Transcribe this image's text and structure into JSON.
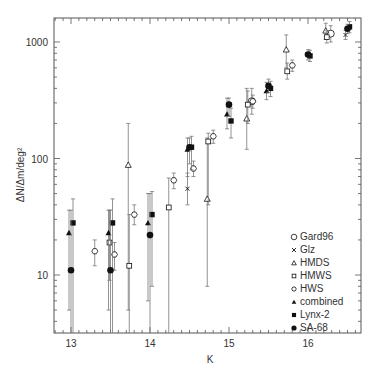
{
  "chart_data": {
    "type": "scatter",
    "title": "",
    "xlabel": "K",
    "ylabel": "ΔN/Δm/deg²",
    "xlim": [
      12.8,
      16.7
    ],
    "ylim": [
      3,
      1500
    ],
    "yscale": "log",
    "grid": false,
    "legend_position": "lower right",
    "x_ticks": [
      "13",
      "14",
      "15",
      "16"
    ],
    "y_ticks": [
      "10",
      "100",
      "1000"
    ],
    "series": [
      {
        "name": "Gard96",
        "marker": "open-circle",
        "points": [
          [
            15.25,
            310,
            240,
            400
          ],
          [
            16.25,
            1180,
            1000,
            1380
          ]
        ]
      },
      {
        "name": "Glz",
        "marker": "x",
        "points": [
          [
            14.5,
            55,
            40,
            75
          ],
          [
            16.5,
            1150,
            1050,
            1260
          ]
        ]
      },
      {
        "name": "HMDS",
        "marker": "open-triangle",
        "points": [
          [
            13.75,
            88,
            5,
            200
          ],
          [
            14.75,
            45,
            8,
            150
          ],
          [
            15.25,
            220,
            120,
            400
          ],
          [
            15.75,
            860,
            600,
            1150
          ],
          [
            16.25,
            1250,
            1050,
            1450
          ]
        ]
      },
      {
        "name": "HMWS",
        "marker": "open-square",
        "points": [
          [
            13.5,
            19,
            9,
            36
          ],
          [
            13.75,
            12,
            3,
            33
          ],
          [
            14.25,
            38,
            3,
            68
          ],
          [
            14.75,
            140,
            40,
            165
          ],
          [
            15.25,
            290,
            200,
            380
          ],
          [
            15.75,
            560,
            480,
            660
          ],
          [
            16.25,
            1100,
            980,
            1250
          ]
        ]
      },
      {
        "name": "HWS",
        "marker": "open-hexagon",
        "points": [
          [
            13.25,
            16,
            12,
            20
          ],
          [
            13.5,
            15,
            11,
            19
          ],
          [
            13.75,
            33,
            27,
            40
          ],
          [
            14.25,
            65,
            55,
            75
          ],
          [
            14.5,
            82,
            70,
            95
          ],
          [
            14.75,
            155,
            135,
            175
          ],
          [
            15.25,
            310,
            270,
            350
          ],
          [
            15.75,
            630,
            560,
            700
          ]
        ]
      },
      {
        "name": "combined",
        "marker": "filled-triangle",
        "points": [
          [
            13.0,
            23,
            5,
            36
          ],
          [
            13.5,
            23,
            5,
            36
          ],
          [
            14.0,
            28,
            6,
            50
          ],
          [
            14.5,
            120,
            70,
            150
          ],
          [
            15.0,
            240,
            180,
            330
          ],
          [
            15.5,
            380,
            320,
            450
          ]
        ]
      },
      {
        "name": "Lynx-2",
        "marker": "filled-square",
        "points": [
          [
            13.0,
            28,
            3,
            45
          ],
          [
            13.5,
            28,
            3,
            45
          ],
          [
            14.0,
            33,
            8,
            52
          ],
          [
            14.5,
            125,
            80,
            155
          ],
          [
            15.0,
            210,
            150,
            270
          ],
          [
            15.5,
            400,
            340,
            460
          ],
          [
            16.0,
            760,
            680,
            850
          ],
          [
            16.5,
            1350,
            1200,
            1500
          ]
        ]
      },
      {
        "name": "SA-68",
        "marker": "filled-circle",
        "points": [
          [
            13.0,
            11,
            3,
            36
          ],
          [
            13.5,
            11,
            3,
            36
          ],
          [
            14.0,
            22,
            3,
            50
          ],
          [
            14.5,
            125,
            90,
            150
          ],
          [
            15.0,
            290,
            230,
            330
          ],
          [
            15.5,
            420,
            370,
            480
          ],
          [
            16.0,
            780,
            700,
            860
          ],
          [
            16.5,
            1300,
            1180,
            1420
          ]
        ]
      }
    ]
  },
  "legend": {
    "items": [
      {
        "label": "Gard96",
        "marker": "open-circle"
      },
      {
        "label": "Glz",
        "marker": "x"
      },
      {
        "label": "HMDS",
        "marker": "open-triangle"
      },
      {
        "label": "HMWS",
        "marker": "open-square"
      },
      {
        "label": "HWS",
        "marker": "open-hexagon"
      },
      {
        "label": "combined",
        "marker": "filled-triangle"
      },
      {
        "label": "Lynx-2",
        "marker": "filled-square"
      },
      {
        "label": "SA-68",
        "marker": "filled-circle"
      }
    ]
  },
  "axes": {
    "x_label": "K",
    "y_label": "ΔN/Δm/deg²",
    "x_ticks": [
      "13",
      "14",
      "15",
      "16"
    ],
    "y_ticks": [
      "10",
      "100",
      "1000"
    ]
  },
  "colors": {
    "axis": "#555555",
    "marker": "#111111",
    "errorbar": "#777777"
  }
}
